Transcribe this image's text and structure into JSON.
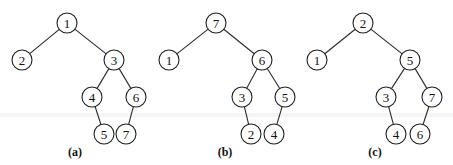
{
  "figure": {
    "node_radius": 10,
    "colors": {
      "stroke": "#1e1e1e",
      "fill": "#ffffff",
      "background": "#ffffff"
    },
    "trees": [
      {
        "id": "a",
        "caption": "(a)",
        "caption_pos": [
          75,
          156
        ],
        "root": "1",
        "nodes": [
          {
            "label": "1",
            "x": 67,
            "y": 23
          },
          {
            "label": "2",
            "x": 22,
            "y": 60
          },
          {
            "label": "3",
            "x": 114,
            "y": 60
          },
          {
            "label": "4",
            "x": 92,
            "y": 97
          },
          {
            "label": "6",
            "x": 136,
            "y": 97
          },
          {
            "label": "5",
            "x": 104,
            "y": 134
          },
          {
            "label": "7",
            "x": 126,
            "y": 134
          }
        ],
        "edges": [
          [
            "1",
            "2"
          ],
          [
            "1",
            "3"
          ],
          [
            "3",
            "4"
          ],
          [
            "3",
            "6"
          ],
          [
            "4",
            "5"
          ],
          [
            "6",
            "7"
          ]
        ]
      },
      {
        "id": "b",
        "caption": "(b)",
        "caption_pos": [
          225,
          156
        ],
        "root": "7",
        "nodes": [
          {
            "label": "7",
            "x": 216,
            "y": 23
          },
          {
            "label": "1",
            "x": 169,
            "y": 60
          },
          {
            "label": "6",
            "x": 262,
            "y": 60
          },
          {
            "label": "3",
            "x": 242,
            "y": 97
          },
          {
            "label": "5",
            "x": 285,
            "y": 97
          },
          {
            "label": "2",
            "x": 251,
            "y": 134
          },
          {
            "label": "4",
            "x": 274,
            "y": 134
          }
        ],
        "edges": [
          [
            "7",
            "1"
          ],
          [
            "7",
            "6"
          ],
          [
            "6",
            "3"
          ],
          [
            "6",
            "5"
          ],
          [
            "3",
            "2"
          ],
          [
            "5",
            "4"
          ]
        ]
      },
      {
        "id": "c",
        "caption": "(c)",
        "caption_pos": [
          375,
          156
        ],
        "root": "2",
        "nodes": [
          {
            "label": "2",
            "x": 363,
            "y": 23
          },
          {
            "label": "1",
            "x": 317,
            "y": 60
          },
          {
            "label": "5",
            "x": 410,
            "y": 60
          },
          {
            "label": "3",
            "x": 386,
            "y": 97
          },
          {
            "label": "7",
            "x": 432,
            "y": 97
          },
          {
            "label": "4",
            "x": 396,
            "y": 134
          },
          {
            "label": "6",
            "x": 420,
            "y": 134
          }
        ],
        "edges": [
          [
            "2",
            "1"
          ],
          [
            "2",
            "5"
          ],
          [
            "5",
            "3"
          ],
          [
            "5",
            "7"
          ],
          [
            "3",
            "4"
          ],
          [
            "7",
            "6"
          ]
        ]
      }
    ]
  }
}
